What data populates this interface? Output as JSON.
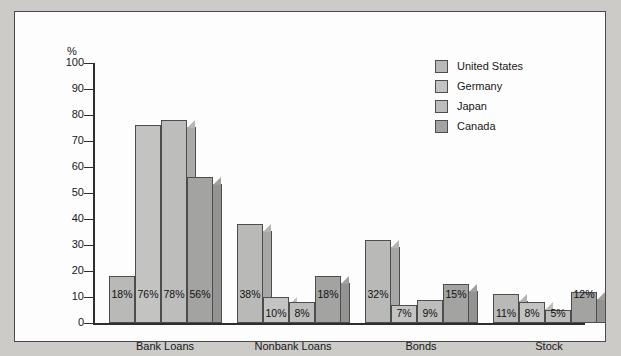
{
  "chart_data": {
    "type": "bar",
    "title": "",
    "subtitle": "",
    "xlabel": "",
    "ylabel": "%",
    "ylim": [
      0,
      100
    ],
    "ytick_labels": [
      "100",
      "90",
      "80",
      "70",
      "60",
      "50",
      "40",
      "30",
      "20",
      "10",
      "0"
    ],
    "ytick_values": [
      100,
      90,
      80,
      70,
      60,
      50,
      40,
      30,
      20,
      10,
      0
    ],
    "grid": false,
    "legend_position": "top-right",
    "categories": [
      "Bank Loans",
      "Nonbank Loans",
      "Bonds",
      "Stock"
    ],
    "series": [
      {
        "name": "United States",
        "color": "#b9b9b7",
        "values": [
          18,
          38,
          32,
          11
        ],
        "labels": [
          "18%",
          "38%",
          "32%",
          "11%"
        ]
      },
      {
        "name": "Germany",
        "color": "#c3c3c1",
        "values": [
          76,
          10,
          7,
          8
        ],
        "labels": [
          "76%",
          "10%",
          "7%",
          "8%"
        ]
      },
      {
        "name": "Japan",
        "color": "#bdbdbb",
        "values": [
          78,
          8,
          9,
          5
        ],
        "labels": [
          "78%",
          "8%",
          "9%",
          "5%"
        ]
      },
      {
        "name": "Canada",
        "color": "#a3a3a1",
        "values": [
          56,
          18,
          15,
          12
        ],
        "labels": [
          "56%",
          "18%",
          "15%",
          "12%"
        ]
      }
    ]
  },
  "legend": {
    "items": [
      {
        "label": "United States"
      },
      {
        "label": "Germany"
      },
      {
        "label": "Japan"
      },
      {
        "label": "Canada"
      }
    ]
  },
  "axis": {
    "unit": "%"
  }
}
